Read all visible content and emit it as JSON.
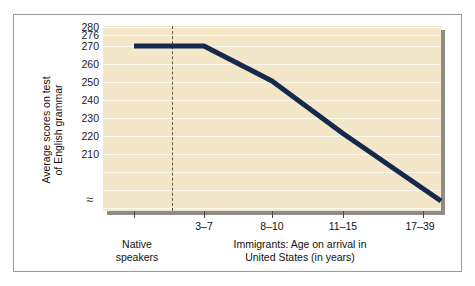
{
  "figure": {
    "panel_bg": "#f4e6c8",
    "gridline_color": "#fdfaf1",
    "line_color": "#14294b",
    "divider_color": "#6b5a3a",
    "frame_color": "#9a9a9a"
  },
  "axis": {
    "y_title_line1": "Average scores on test",
    "y_title_line2": "of English grammar",
    "y_ticks": [
      "280",
      "276",
      "270",
      "260",
      "250",
      "240",
      "230",
      "220",
      "210"
    ],
    "y_break_symbol": "≈",
    "x_tick_labels": [
      "3–7",
      "8–10",
      "11–15",
      "17–39"
    ],
    "x_group_left_line1": "Native",
    "x_group_left_line2": "speakers",
    "x_group_right_line1": "Immigrants: Age on arrival in",
    "x_group_right_line2": "United States (in years)"
  },
  "chart_data": {
    "type": "line",
    "title": "",
    "xlabel": "Immigrants: Age on arrival in United States (in years)",
    "ylabel": "Average scores on test of English grammar",
    "categories": [
      "Native speakers",
      "3–7",
      "8–10",
      "11–15",
      "17–39"
    ],
    "values": [
      272,
      272,
      258,
      237,
      210
    ],
    "ylim": [
      206,
      280
    ],
    "yticks": [
      210,
      220,
      230,
      240,
      250,
      260,
      270,
      276,
      280
    ],
    "y_axis_broken": true,
    "grid": true,
    "legend": "none",
    "series": [
      {
        "name": "Average score on test of English grammar",
        "points": [
          {
            "x": "Native speakers",
            "y": 272
          },
          {
            "x": "3–7",
            "y": 272
          },
          {
            "x": "8–10",
            "y": 258
          },
          {
            "x": "11–15",
            "y": 237
          },
          {
            "x": "17–39",
            "y": 210
          }
        ]
      }
    ],
    "annotations": [
      {
        "type": "vertical-dashed-line",
        "between": [
          "Native speakers",
          "3–7"
        ]
      }
    ]
  }
}
